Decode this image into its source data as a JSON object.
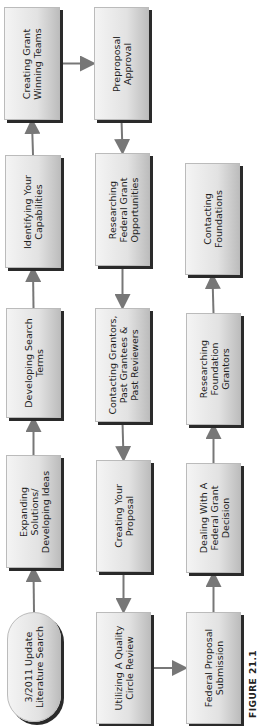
{
  "figure_label": "FIGURE 21.1",
  "nodes": [
    {
      "id": "lit",
      "shape": "oval",
      "lines": [
        "3/2011 Update",
        "Literature Search"
      ]
    },
    {
      "id": "expand",
      "shape": "box",
      "lines": [
        "Expanding",
        "Solutions/",
        "Developing Ideas"
      ]
    },
    {
      "id": "terms",
      "shape": "box",
      "lines": [
        "Developing Search",
        "Terms"
      ]
    },
    {
      "id": "capab",
      "shape": "box",
      "lines": [
        "Identifying Your",
        "Capabilities"
      ]
    },
    {
      "id": "teams",
      "shape": "box",
      "lines": [
        "Creating Grant",
        "Winning Teams"
      ]
    },
    {
      "id": "preprop",
      "shape": "box",
      "lines": [
        "Preproposal",
        "Approval"
      ]
    },
    {
      "id": "resfed",
      "shape": "box",
      "lines": [
        "Researching",
        "Federal Grant",
        "Opportunities"
      ]
    },
    {
      "id": "contact",
      "shape": "box",
      "lines": [
        "Contacting Grantors,",
        "Past Grantees &",
        "Past Reviewers"
      ]
    },
    {
      "id": "create",
      "shape": "box",
      "lines": [
        "Creating Your",
        "Proposal"
      ]
    },
    {
      "id": "quality",
      "shape": "box",
      "lines": [
        "Utilizing A Quality",
        "Circle Review"
      ]
    },
    {
      "id": "submit",
      "shape": "box",
      "lines": [
        "Federal Proposal",
        "Submission"
      ]
    },
    {
      "id": "dealing",
      "shape": "box",
      "lines": [
        "Dealing With A",
        "Federal Grant",
        "Decision"
      ]
    },
    {
      "id": "resfound",
      "shape": "box",
      "lines": [
        "Researching",
        "Foundation",
        "Grantors"
      ]
    },
    {
      "id": "contfound",
      "shape": "box",
      "lines": [
        "Contacting",
        "Foundations"
      ]
    }
  ],
  "edges": [
    [
      "lit",
      "expand"
    ],
    [
      "expand",
      "terms"
    ],
    [
      "terms",
      "capab"
    ],
    [
      "capab",
      "teams"
    ],
    [
      "teams",
      "preprop"
    ],
    [
      "preprop",
      "resfed"
    ],
    [
      "resfed",
      "contact"
    ],
    [
      "contact",
      "create"
    ],
    [
      "create",
      "quality"
    ],
    [
      "quality",
      "submit"
    ],
    [
      "submit",
      "dealing"
    ],
    [
      "dealing",
      "resfound"
    ],
    [
      "resfound",
      "contfound"
    ]
  ]
}
